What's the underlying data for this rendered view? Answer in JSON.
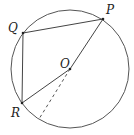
{
  "diagram": {
    "type": "circle-geometry",
    "colors": {
      "stroke": "#555555",
      "text": "#222222",
      "background": "#ffffff"
    },
    "circle": {
      "center": "O",
      "cx": 70,
      "cy": 69,
      "r": 59
    },
    "points": {
      "P": {
        "label": "P",
        "x": 103,
        "y": 19,
        "label_x": 106,
        "label_y": 14
      },
      "Q": {
        "label": "Q",
        "x": 23,
        "y": 33,
        "label_x": 8,
        "label_y": 32
      },
      "R": {
        "label": "R",
        "x": 22,
        "y": 103,
        "label_x": 11,
        "label_y": 117
      },
      "O": {
        "label": "O",
        "x": 70,
        "y": 69,
        "label_x": 60,
        "label_y": 68
      }
    },
    "segments": [
      {
        "from": "Q",
        "to": "P",
        "style": "solid"
      },
      {
        "from": "Q",
        "to": "R",
        "style": "solid"
      },
      {
        "from": "R",
        "to": "O",
        "style": "solid"
      },
      {
        "from": "O",
        "to": "P",
        "style": "solid"
      },
      {
        "from": "O",
        "to": "circle",
        "x2": 39,
        "y2": 119,
        "style": "dashed"
      }
    ]
  }
}
